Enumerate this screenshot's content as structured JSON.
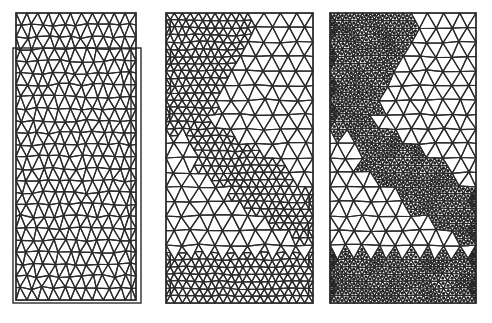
{
  "figure": {
    "background": "#ffffff",
    "line_color": "#2b2b2b",
    "dot_color": "#222222",
    "panels": [
      {
        "id": "panel-1",
        "label": "original-and-deformed-mesh",
        "x": 16,
        "y": 13,
        "width": 120,
        "height": 287,
        "cols": 11,
        "rows": 24,
        "overlay_frame": {
          "x": 13,
          "y": 48,
          "width": 128,
          "height": 255
        },
        "inner_line_x": 131,
        "refined_regions": [],
        "dotted_regions": [],
        "jitter": 1.6
      },
      {
        "id": "panel-2",
        "label": "refined-mesh",
        "x": 166,
        "y": 13,
        "width": 147,
        "height": 290,
        "cols": 9,
        "rows": 20,
        "refined_regions": [
          {
            "shape": "top-left-wedge",
            "x0": 0.0,
            "x1": 0.62,
            "y0": 0.0,
            "y1": 0.42
          },
          {
            "shape": "diagonal-band",
            "from": [
              0.25,
              0.45
            ],
            "to": [
              1.0,
              0.72
            ],
            "width": 0.16
          },
          {
            "shape": "bottom-band",
            "y0": 0.83,
            "y1": 1.0
          }
        ],
        "dotted_regions": [],
        "jitter": 1.2
      },
      {
        "id": "panel-3",
        "label": "refined-mesh-with-nodes",
        "x": 330,
        "y": 13,
        "width": 146,
        "height": 290,
        "cols": 9,
        "rows": 20,
        "refined_regions": [
          {
            "shape": "top-left-wedge",
            "x0": 0.0,
            "x1": 0.62,
            "y0": 0.0,
            "y1": 0.42
          },
          {
            "shape": "diagonal-band",
            "from": [
              0.25,
              0.45
            ],
            "to": [
              1.0,
              0.72
            ],
            "width": 0.16
          },
          {
            "shape": "bottom-band",
            "y0": 0.83,
            "y1": 1.0
          }
        ],
        "dotted_regions": "same-as-refined",
        "jitter": 1.2
      }
    ]
  }
}
